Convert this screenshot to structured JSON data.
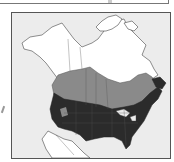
{
  "figure": {
    "type": "range-map",
    "region": "North America",
    "legend_visible": false,
    "caption_visible": false
  },
  "map": {
    "zones": [
      {
        "name": "core-range",
        "description": "contiguous United States and southern Canada",
        "color": "#2b2b2b"
      },
      {
        "name": "secondary-range",
        "description": "southern-central Canada band",
        "color": "#8a8a8a"
      },
      {
        "name": "outside-range",
        "description": "northern Canada, Alaska, Mexico",
        "color": "#ffffff"
      }
    ],
    "colors": {
      "ocean": "#ececec",
      "border": "#555555",
      "outline": "#444444"
    }
  }
}
